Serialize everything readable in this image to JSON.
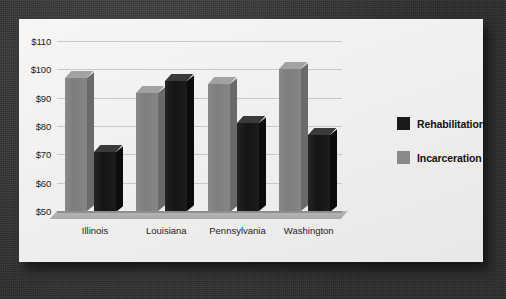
{
  "chart_data": {
    "type": "bar",
    "title": "",
    "xlabel": "",
    "ylabel": "",
    "ylim": [
      50,
      110
    ],
    "ytick_step": 10,
    "ytick_labels": [
      "$50",
      "$60",
      "$70",
      "$80",
      "$90",
      "$100",
      "$110"
    ],
    "ytick_values": [
      50,
      60,
      70,
      80,
      90,
      100,
      110
    ],
    "grid": true,
    "legend_position": "right",
    "categories": [
      "Illinois",
      "Louisiana",
      "Pennsylvania",
      "Washington"
    ],
    "series": [
      {
        "name": "Incarceration",
        "color": "#808080",
        "values": [
          97,
          91.5,
          95,
          100
        ]
      },
      {
        "name": "Rehabilitation",
        "color": "#1a1a1a",
        "values": [
          71,
          96,
          81,
          77
        ]
      }
    ]
  },
  "legend": {
    "items": [
      {
        "label": "Rehabilitation",
        "swatch": "dark"
      },
      {
        "label": "Incarceration",
        "swatch": "gray"
      }
    ]
  },
  "colors": {
    "bar_incarceration": "#808080",
    "bar_rehabilitation": "#1a1a1a",
    "card_background": "#f2f1ef",
    "backdrop": "#3c3a38",
    "gridline": "#c9c8c6",
    "text": "#1d1d1d"
  }
}
